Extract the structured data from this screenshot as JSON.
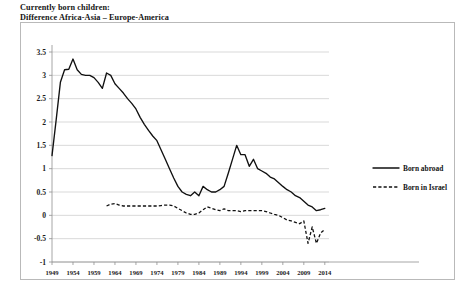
{
  "title": {
    "line1": "Currently born children:",
    "line2": "Difference Africa-Asia – Europe-America"
  },
  "legend": {
    "position": "right",
    "items": [
      {
        "label": "Born abroad",
        "style": "solid"
      },
      {
        "label": "Born in Israel",
        "style": "dashed"
      }
    ]
  },
  "chart_data": {
    "type": "line",
    "title": "Currently born children: Difference Africa-Asia – Europe-America",
    "xlabel": "",
    "ylabel": "",
    "xlim": [
      1949,
      2015
    ],
    "ylim": [
      -1,
      3.5
    ],
    "grid": true,
    "ytick_labels": [
      "3.5",
      "3",
      "2.5",
      "2",
      "1.5",
      "1",
      "0.5",
      "0",
      "-0.5",
      "-1"
    ],
    "yticks": [
      3.5,
      3,
      2.5,
      2,
      1.5,
      1,
      0.5,
      0,
      -0.5,
      -1
    ],
    "xtick_labels": [
      "1949",
      "1954",
      "1959",
      "1964",
      "1969",
      "1974",
      "1979",
      "1984",
      "1989",
      "1994",
      "1999",
      "2004",
      "2009",
      "2014"
    ],
    "xticks": [
      1949,
      1954,
      1959,
      1964,
      1969,
      1974,
      1979,
      1984,
      1989,
      1994,
      1999,
      2004,
      2009,
      2014
    ],
    "legend_position": "right",
    "series": [
      {
        "name": "Born abroad",
        "style": "solid",
        "x": [
          1949,
          1950,
          1951,
          1952,
          1953,
          1954,
          1955,
          1956,
          1957,
          1958,
          1959,
          1960,
          1961,
          1962,
          1963,
          1964,
          1965,
          1966,
          1967,
          1968,
          1969,
          1970,
          1971,
          1972,
          1973,
          1974,
          1975,
          1976,
          1977,
          1978,
          1979,
          1980,
          1981,
          1982,
          1983,
          1984,
          1985,
          1986,
          1987,
          1988,
          1989,
          1990,
          1991,
          1992,
          1993,
          1994,
          1995,
          1996,
          1997,
          1998,
          1999,
          2000,
          2001,
          2002,
          2003,
          2004,
          2005,
          2006,
          2007,
          2008,
          2009,
          2010,
          2011,
          2012,
          2013,
          2014
        ],
        "values": [
          1.28,
          2.05,
          2.85,
          3.12,
          3.13,
          3.35,
          3.12,
          3.02,
          3.0,
          3.0,
          2.95,
          2.85,
          2.72,
          3.05,
          3.0,
          2.82,
          2.72,
          2.62,
          2.5,
          2.4,
          2.28,
          2.1,
          1.95,
          1.82,
          1.7,
          1.6,
          1.4,
          1.2,
          1.0,
          0.8,
          0.62,
          0.5,
          0.45,
          0.42,
          0.5,
          0.42,
          0.62,
          0.55,
          0.5,
          0.5,
          0.55,
          0.62,
          0.9,
          1.2,
          1.5,
          1.3,
          1.3,
          1.05,
          1.2,
          1.0,
          0.95,
          0.9,
          0.82,
          0.78,
          0.7,
          0.62,
          0.55,
          0.5,
          0.42,
          0.38,
          0.3,
          0.22,
          0.18,
          0.1,
          0.12,
          0.15
        ]
      },
      {
        "name": "Born in Israel",
        "style": "dashed",
        "x": [
          1962,
          1963,
          1964,
          1965,
          1966,
          1967,
          1968,
          1969,
          1970,
          1971,
          1972,
          1973,
          1974,
          1975,
          1976,
          1977,
          1978,
          1979,
          1980,
          1981,
          1982,
          1983,
          1984,
          1985,
          1986,
          1987,
          1988,
          1989,
          1990,
          1991,
          1992,
          1993,
          1994,
          1995,
          1996,
          1997,
          1998,
          1999,
          2000,
          2001,
          2002,
          2003,
          2004,
          2005,
          2006,
          2007,
          2008,
          2009,
          2010,
          2011,
          2012,
          2013,
          2014
        ],
        "values": [
          0.2,
          0.24,
          0.25,
          0.22,
          0.2,
          0.2,
          0.2,
          0.2,
          0.2,
          0.2,
          0.2,
          0.2,
          0.2,
          0.21,
          0.22,
          0.22,
          0.2,
          0.15,
          0.1,
          0.05,
          0.02,
          0.02,
          0.05,
          0.12,
          0.18,
          0.15,
          0.12,
          0.1,
          0.14,
          0.1,
          0.1,
          0.1,
          0.08,
          0.1,
          0.1,
          0.1,
          0.1,
          0.1,
          0.08,
          0.05,
          0.02,
          0.0,
          -0.05,
          -0.1,
          -0.12,
          -0.15,
          -0.18,
          -0.12,
          -0.6,
          -0.25,
          -0.6,
          -0.38,
          -0.3
        ]
      }
    ]
  }
}
